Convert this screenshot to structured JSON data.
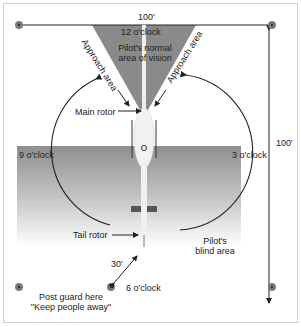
{
  "diagram": {
    "labels": {
      "top_distance": "100'",
      "right_distance": "100'",
      "twelve": "12 o'clock",
      "three": "3 o'clock",
      "six": "6 o'clock",
      "nine": "9 o'clock",
      "vision_line1": "Pilot's normal",
      "vision_line2": "area of vision",
      "approach_left": "Approach area",
      "approach_right": "Approach area",
      "main_rotor": "Main rotor",
      "tail_rotor": "Tail rotor",
      "guard_distance": "30'",
      "blind_line1": "Pilot's",
      "blind_line2": "blind area",
      "guard_line1": "Post guard here",
      "guard_line2": "\"Keep people away\""
    },
    "colors": {
      "vision_wedge": "#8a8a8a",
      "blind_area_top": "#8f8f8f",
      "blind_area_bottom": "#ffffff",
      "marker": "#7a7a7a",
      "lines": "#222222"
    }
  }
}
